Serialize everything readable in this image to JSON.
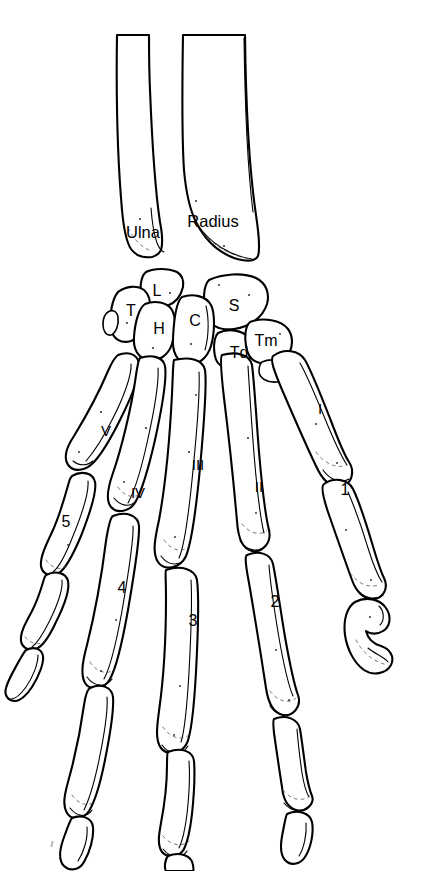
{
  "figure": {
    "view": "dorsal",
    "background_color": "#ffffff",
    "line_color": "#000000",
    "width": 426,
    "height": 871
  },
  "labels": {
    "forearm": [
      {
        "key": "ulna",
        "text": "Ulna",
        "x": 143,
        "y": 232,
        "bone": "ulna"
      },
      {
        "key": "radius",
        "text": "Radius",
        "x": 213,
        "y": 221,
        "bone": "radius"
      }
    ],
    "carpals": [
      {
        "key": "triquetral",
        "text": "T",
        "x": 131,
        "y": 311
      },
      {
        "key": "lunate",
        "text": "L",
        "x": 157,
        "y": 291
      },
      {
        "key": "hamate",
        "text": "H",
        "x": 159,
        "y": 329
      },
      {
        "key": "capitate",
        "text": "C",
        "x": 195,
        "y": 321
      },
      {
        "key": "scaphoid",
        "text": "S",
        "x": 234,
        "y": 306
      },
      {
        "key": "trapezoid",
        "text": "Td",
        "x": 239,
        "y": 353
      },
      {
        "key": "trapezium",
        "text": "Tm",
        "x": 266,
        "y": 341
      }
    ],
    "metacarpals": [
      {
        "key": "metacarpal-1",
        "text": "I",
        "x": 320,
        "y": 408
      },
      {
        "key": "metacarpal-2",
        "text": "II",
        "x": 259,
        "y": 486
      },
      {
        "key": "metacarpal-3",
        "text": "III",
        "x": 198,
        "y": 464
      },
      {
        "key": "metacarpal-4",
        "text": "IV",
        "x": 138,
        "y": 492
      },
      {
        "key": "metacarpal-5",
        "text": "V",
        "x": 106,
        "y": 430
      }
    ],
    "phalanges": [
      {
        "key": "digit-1",
        "text": "1",
        "x": 345,
        "y": 490
      },
      {
        "key": "digit-2",
        "text": "2",
        "x": 275,
        "y": 602
      },
      {
        "key": "digit-3",
        "text": "3",
        "x": 193,
        "y": 621
      },
      {
        "key": "digit-4",
        "text": "4",
        "x": 122,
        "y": 588
      },
      {
        "key": "digit-5",
        "text": "5",
        "x": 66,
        "y": 522
      }
    ]
  },
  "legend_note": ""
}
